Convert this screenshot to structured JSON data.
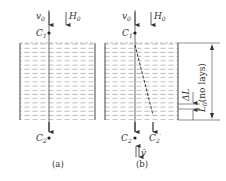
{
  "panel_a": {
    "caption": "(a)",
    "labels": {
      "v0": "v",
      "v0_sub": "0",
      "H0": "H",
      "H0_sub": "0",
      "C1": "C",
      "C1_sub": "1",
      "C2": "C",
      "C2_sub": "2"
    }
  },
  "panel_b": {
    "caption": "(b)",
    "labels": {
      "v0": "v",
      "v0_sub": "0",
      "H0": "H",
      "H0_sub": "0",
      "C1": "C",
      "C1_sub": "1",
      "C2": "C",
      "C2_sub": "2",
      "C2p": "C",
      "C2p_sub": "2",
      "C2p_prime": "′",
      "vbar": "v̄",
      "deltaL": "ΔL",
      "L0": "L",
      "L0_sub": "0",
      "L0_note": "(no lays)"
    }
  },
  "colors": {
    "line": "#444444",
    "dash": "#777777",
    "text": "#333333"
  }
}
